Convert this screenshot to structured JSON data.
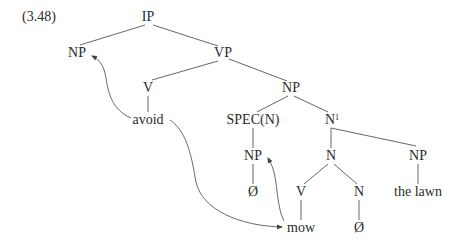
{
  "example_number": "(3.48)",
  "colors": {
    "line": "#555555",
    "text": "#2a2a2a",
    "background": "#ffffff"
  },
  "nodes": {
    "ip": {
      "label": "IP",
      "x": 148,
      "y": 17
    },
    "np_subject": {
      "label": "NP",
      "x": 77,
      "y": 53
    },
    "vp": {
      "label": "VP",
      "x": 223,
      "y": 53
    },
    "v_main": {
      "label": "V",
      "x": 148,
      "y": 88
    },
    "np_object": {
      "label": "NP",
      "x": 291,
      "y": 88
    },
    "avoid": {
      "label": "avoid",
      "x": 148,
      "y": 120
    },
    "spec_n": {
      "label": "SPEC(N)",
      "x": 253,
      "y": 120
    },
    "n_bar": {
      "label": "N",
      "sup": "1",
      "x": 331,
      "y": 120
    },
    "np_spec": {
      "label": "NP",
      "x": 253,
      "y": 156
    },
    "n_compound": {
      "label": "N",
      "x": 331,
      "y": 156
    },
    "np_lawn": {
      "label": "NP",
      "x": 418,
      "y": 156
    },
    "empty_spec": {
      "label": "Ø",
      "x": 253,
      "y": 192
    },
    "v_mow": {
      "label": "V",
      "x": 301,
      "y": 192
    },
    "n_empty": {
      "label": "N",
      "x": 359,
      "y": 192
    },
    "the_lawn": {
      "label": "the lawn",
      "x": 418,
      "y": 192
    },
    "mow": {
      "label": "mow",
      "x": 301,
      "y": 228
    },
    "empty_n": {
      "label": "Ø",
      "x": 359,
      "y": 228
    }
  },
  "edges": [
    [
      "ip",
      "np_subject"
    ],
    [
      "ip",
      "vp"
    ],
    [
      "vp",
      "v_main"
    ],
    [
      "vp",
      "np_object"
    ],
    [
      "v_main",
      "avoid"
    ],
    [
      "np_object",
      "spec_n"
    ],
    [
      "np_object",
      "n_bar"
    ],
    [
      "spec_n",
      "np_spec"
    ],
    [
      "np_spec",
      "empty_spec"
    ],
    [
      "n_bar",
      "n_compound"
    ],
    [
      "n_bar",
      "np_lawn"
    ],
    [
      "n_compound",
      "v_mow"
    ],
    [
      "n_compound",
      "n_empty"
    ],
    [
      "v_mow",
      "mow"
    ],
    [
      "n_empty",
      "empty_n"
    ],
    [
      "np_lawn",
      "the_lawn"
    ]
  ],
  "arrows": [
    {
      "from": "avoid",
      "to": "np_subject",
      "description": "control arrow from avoid to subject NP"
    },
    {
      "from": "avoid",
      "to": "mow",
      "description": "arrow from avoid down to mow"
    },
    {
      "from": "mow",
      "to": "np_spec",
      "description": "arrow from mow up to SPEC NP"
    }
  ]
}
